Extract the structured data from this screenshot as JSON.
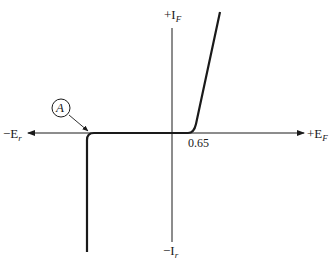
{
  "diagram": {
    "type": "diode V-I characteristic curve",
    "axes": {
      "x_positive_label": "+E",
      "x_positive_sub": "F",
      "x_negative_label": "−E",
      "x_negative_sub": "r",
      "y_positive_label": "+I",
      "y_positive_sub": "F",
      "y_negative_label": "−I",
      "y_negative_sub": "r"
    },
    "annotations": {
      "knee_voltage": "0.65",
      "point_label": "A",
      "point_description": "reverse breakdown (Zener/avalanche) knee"
    },
    "colors": {
      "line": "#1a1a1a",
      "background": "#ffffff"
    }
  }
}
